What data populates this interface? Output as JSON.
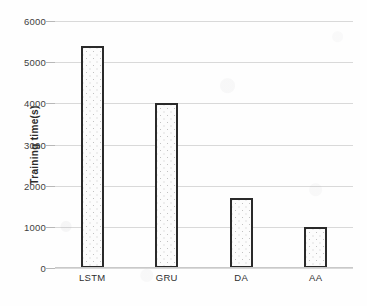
{
  "chart_data": {
    "type": "bar",
    "title": "",
    "xlabel": "",
    "ylabel": "Training time(s)",
    "categories": [
      "LSTM",
      "GRU",
      "DA",
      "AA"
    ],
    "values": [
      5400,
      4000,
      1700,
      1000
    ],
    "series": [
      {
        "name": "Training time(s)",
        "values": [
          5400,
          4000,
          1700,
          1000
        ]
      }
    ],
    "ylim": [
      0,
      6000
    ],
    "ytick_labels": [
      "0",
      "1000",
      "2000",
      "3000",
      "4000",
      "5000",
      "6000"
    ],
    "ytick_values": [
      0,
      1000,
      2000,
      3000,
      4000,
      5000,
      6000
    ],
    "grid": true,
    "legend": false,
    "legend_position": "none",
    "bar_fill": "dotted-stipple",
    "colors": {
      "bar_border": "#2a2a2a",
      "bar_fill": "#fcfcfc",
      "bar_dots": "#c2c2c2",
      "gridline": "#d9d9d9",
      "text": "#2f2f2f",
      "background": "#ffffff"
    }
  }
}
